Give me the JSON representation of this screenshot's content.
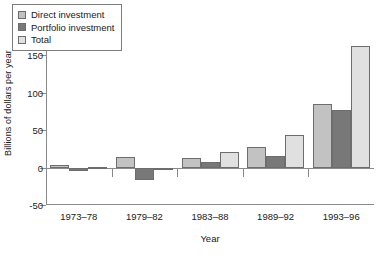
{
  "chart_data": {
    "type": "bar",
    "title": "",
    "xlabel": "Year",
    "ylabel": "Billions of dollars per year",
    "categories": [
      "1973–78",
      "1979–82",
      "1983–88",
      "1989–92",
      "1993–96"
    ],
    "series": [
      {
        "name": "Direct investment",
        "values": [
          4,
          14,
          13,
          28,
          85
        ],
        "color": "#c2c2c2"
      },
      {
        "name": "Portfolio investment",
        "values": [
          -4,
          -17,
          8,
          15,
          77
        ],
        "color": "#787878"
      },
      {
        "name": "Total",
        "values": [
          1,
          -3,
          21,
          43,
          162
        ],
        "color": "#e0e0e0"
      }
    ],
    "ylim": [
      -50,
      200
    ],
    "yticks": [
      -50,
      0,
      50,
      100,
      150,
      200
    ],
    "ytick_labels": [
      "-50",
      "0",
      "50",
      "100",
      "150",
      "200"
    ],
    "grid": false,
    "legend_position": "upper-left",
    "legend_entries": [
      "Direct investment",
      "Portfolio investment",
      "Total"
    ]
  }
}
